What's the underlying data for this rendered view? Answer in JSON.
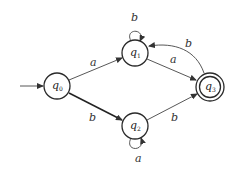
{
  "diagram": {
    "type": "finite-automaton",
    "states": [
      {
        "id": "q0",
        "label": "q",
        "sub": "0",
        "initial": true,
        "accepting": false
      },
      {
        "id": "q1",
        "label": "q",
        "sub": "1",
        "initial": false,
        "accepting": false
      },
      {
        "id": "q2",
        "label": "q",
        "sub": "2",
        "initial": false,
        "accepting": false
      },
      {
        "id": "q3",
        "label": "q",
        "sub": "3",
        "initial": false,
        "accepting": true
      }
    ],
    "transitions": [
      {
        "from": "q0",
        "to": "q1",
        "symbol": "a"
      },
      {
        "from": "q0",
        "to": "q2",
        "symbol": "b"
      },
      {
        "from": "q1",
        "to": "q1",
        "symbol": "b"
      },
      {
        "from": "q1",
        "to": "q3",
        "symbol": "a"
      },
      {
        "from": "q2",
        "to": "q2",
        "symbol": "a"
      },
      {
        "from": "q2",
        "to": "q3",
        "symbol": "b"
      },
      {
        "from": "q3",
        "to": "q1",
        "symbol": "b"
      }
    ]
  }
}
